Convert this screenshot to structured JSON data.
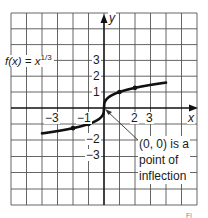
{
  "chart_data": {
    "type": "line",
    "title": "",
    "function_label": "f(x) = x^1/3",
    "function_label_parts": {
      "prefix": "f(x) = x",
      "exponent": "1/3"
    },
    "xlabel": "x",
    "ylabel": "y",
    "xlim": [
      -6,
      6
    ],
    "ylim": [
      -6,
      6
    ],
    "grid": true,
    "x_tick_labels": [
      "-3",
      "-1",
      "2",
      "3"
    ],
    "x_ticks": [
      -3,
      -1,
      2,
      3
    ],
    "y_tick_labels": [
      "3",
      "2",
      "1",
      "-2",
      "-3"
    ],
    "y_ticks": [
      3,
      2,
      1,
      -2,
      -3
    ],
    "series": [
      {
        "name": "f(x) = x^(1/3)",
        "x": [
          -4,
          -3,
          -2,
          -1,
          -0.5,
          -0.125,
          0,
          0.125,
          0.5,
          1,
          2,
          3,
          4
        ],
        "y": [
          -1.587,
          -1.442,
          -1.26,
          -1,
          -0.794,
          -0.5,
          0,
          0.5,
          0.794,
          1,
          1.26,
          1.442,
          1.587
        ]
      }
    ],
    "marked_points": [
      {
        "x": -2,
        "y": -1.26
      },
      {
        "x": -1,
        "y": -1
      },
      {
        "x": 1,
        "y": 1
      },
      {
        "x": 2,
        "y": 1.26
      }
    ],
    "annotations": [
      {
        "text": "(0, 0) is a\npoint of\ninflection",
        "points_to": {
          "x": 0,
          "y": 0
        }
      }
    ]
  },
  "labels": {
    "x_axis": "x",
    "y_axis": "y",
    "func_prefix": "f(x) = x",
    "func_exponent": "1/3",
    "annotation": "(0, 0) is a\npoint of\ninflection",
    "ticks": {
      "xm3": "−3",
      "xm1": "−1",
      "x2": "2",
      "x3": "3",
      "y3": "3",
      "y2": "2",
      "y1": "1",
      "ym2": "−2",
      "ym3": "−3"
    },
    "corner": "Fi"
  }
}
